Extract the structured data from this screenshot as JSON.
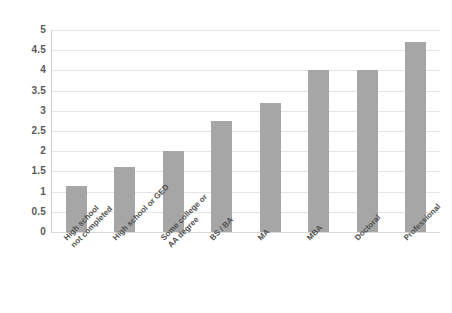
{
  "chart_data": {
    "type": "bar",
    "title": "",
    "xlabel": "",
    "ylabel": "",
    "ylim": [
      0,
      5
    ],
    "grid": true,
    "legend": false,
    "bar_color": "#a6a6a6",
    "gridline_color": "#e6e6e6",
    "label_color": "#5a5a5a",
    "categories": [
      "High school\nnot completed",
      "High school or GED",
      "Some college or\nAA degree",
      "BS / BA",
      "MA",
      "MBA",
      "Doctoral",
      "Professional"
    ],
    "category_lines": [
      [
        "High school",
        "not completed"
      ],
      [
        "High school or GED"
      ],
      [
        "Some college or",
        "AA degree"
      ],
      [
        "BS / BA"
      ],
      [
        "MA"
      ],
      [
        "MBA"
      ],
      [
        "Doctoral"
      ],
      [
        "Professional"
      ]
    ],
    "values": [
      1.15,
      1.6,
      2.0,
      2.75,
      3.2,
      4.0,
      4.0,
      4.7
    ],
    "yticks": [
      0,
      0.5,
      1,
      1.5,
      2,
      2.5,
      3,
      3.5,
      4,
      4.5,
      5
    ],
    "ytick_labels": [
      "0",
      "0.5",
      "1",
      "1.5",
      "2",
      "2.5",
      "3",
      "3.5",
      "4",
      "4.5",
      "5"
    ]
  }
}
